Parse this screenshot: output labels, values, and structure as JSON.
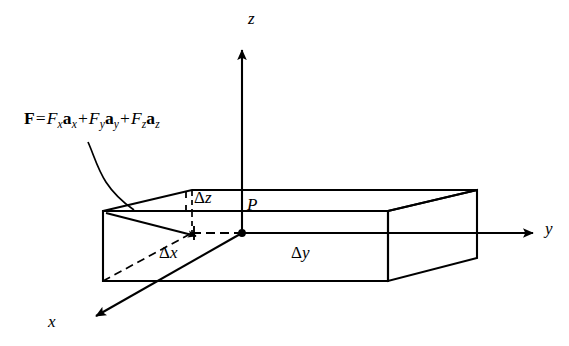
{
  "figure": {
    "background_color": "#ffffff",
    "ink_color": "#000000"
  },
  "axes": [
    {
      "name": "z-axis",
      "label": "z",
      "direction": "up"
    },
    {
      "name": "y-axis",
      "label": "y",
      "direction": "right"
    },
    {
      "name": "x-axis",
      "label": "x",
      "direction": "down-left"
    }
  ],
  "axis_labels": {
    "z": "z",
    "y": "y",
    "x": "x"
  },
  "point": {
    "label": "P",
    "description": "corner point of the differential volume element"
  },
  "dimensions": [
    {
      "name": "delta-z",
      "symbol": "Δ",
      "variable": "z"
    },
    {
      "name": "delta-x",
      "symbol": "Δ",
      "variable": "x"
    },
    {
      "name": "delta-y",
      "symbol": "Δ",
      "variable": "y"
    }
  ],
  "dimension_labels": {
    "delta_z_symbol": "Δ",
    "delta_z_var": "z",
    "delta_x_symbol": "Δ",
    "delta_x_var": "x",
    "delta_y_symbol": "Δ",
    "delta_y_var": "y"
  },
  "formula": {
    "name": "force-vector-equation",
    "plain_text": "F = Fx ax + Fy ay + Fz az",
    "lhs_bold": "F",
    "equals": "=",
    "terms": [
      {
        "coef": "F",
        "coef_sub": "x",
        "unit": "a",
        "unit_sub": "x"
      },
      {
        "coef": "F",
        "coef_sub": "y",
        "unit": "a",
        "unit_sub": "y"
      },
      {
        "coef": "F",
        "coef_sub": "z",
        "unit": "a",
        "unit_sub": "z"
      }
    ],
    "plus": "+"
  },
  "annotations": {
    "leader_arrow": "curved-leader-from-formula-to-box-corner",
    "force_arrow": "straight-arrow-to-interior-point"
  }
}
